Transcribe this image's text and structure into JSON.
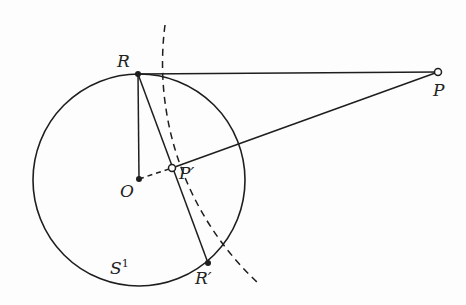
{
  "diagram": {
    "type": "geometry-inversion",
    "colors": {
      "stroke": "#1e1e1e",
      "background": "#fdfdfd"
    },
    "circle": {
      "name": "S1",
      "cx": 139,
      "cy": 180,
      "r": 106
    },
    "points": {
      "R": {
        "label": "R",
        "x": 138,
        "y": 74
      },
      "O": {
        "label": "O",
        "x": 139,
        "y": 179
      },
      "P_prime": {
        "label": "P′",
        "x": 172,
        "y": 168
      },
      "R_prime": {
        "label": "R′",
        "x": 208,
        "y": 263
      },
      "P": {
        "label": "P",
        "x": 438,
        "y": 72
      }
    },
    "labels": {
      "R": "R",
      "O": "O",
      "P_prime": "P′",
      "R_prime": "R′",
      "P": "P",
      "S1_base": "S",
      "S1_sup": "1"
    },
    "segments": [
      {
        "from": "R",
        "to": "P",
        "style": "solid"
      },
      {
        "from": "R",
        "to": "O",
        "style": "solid"
      },
      {
        "from": "R",
        "to": "R_prime",
        "style": "solid"
      },
      {
        "from": "P_prime",
        "to": "P",
        "style": "solid"
      },
      {
        "from": "O",
        "to": "P_prime",
        "style": "dashed"
      }
    ],
    "dashed_arc": {
      "center": "P",
      "radius": 300,
      "from": [
        165,
        25
      ],
      "to": [
        258,
        283
      ]
    }
  }
}
